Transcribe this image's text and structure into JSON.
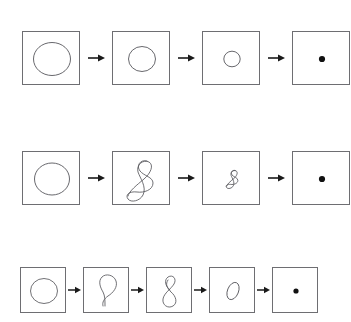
{
  "figure": {
    "background_color": "#ffffff",
    "frame_border_color": "#6e6e72",
    "curve_color": "#4a4a4f",
    "dot_color": "#111111",
    "arrow_color": "#1a1a1a",
    "rows": [
      {
        "id": "row-1",
        "name": "circle-shrinking-sequence",
        "frame_size": 58,
        "frame_height": 54,
        "x": 22,
        "y": 31,
        "gap": 32,
        "panels": [
          {
            "id": "r1p1",
            "shape": "circle",
            "label": "large-circle",
            "radius": 18
          },
          {
            "id": "r1p2",
            "shape": "circle",
            "label": "medium-circle",
            "radius": 13
          },
          {
            "id": "r1p3",
            "shape": "circle",
            "label": "small-circle",
            "radius": 8
          },
          {
            "id": "r1p4",
            "shape": "dot",
            "label": "point",
            "radius": 3
          }
        ],
        "arrows": [
          "arrow-1",
          "arrow-2",
          "arrow-3"
        ]
      },
      {
        "id": "row-2",
        "name": "figure-eight-shrinking-sequence",
        "frame_size": 58,
        "frame_height": 54,
        "x": 22,
        "y": 151,
        "gap": 32,
        "panels": [
          {
            "id": "r2p1",
            "shape": "circle",
            "label": "large-circle",
            "radius": 17
          },
          {
            "id": "r2p2",
            "shape": "figure-eight-tall",
            "label": "large-figure-eight",
            "scale": 1.0
          },
          {
            "id": "r2p3",
            "shape": "figure-eight-tall",
            "label": "small-figure-eight",
            "scale": 0.42
          },
          {
            "id": "r2p4",
            "shape": "dot",
            "label": "point",
            "radius": 3
          }
        ],
        "arrows": [
          "arrow-1",
          "arrow-2",
          "arrow-3"
        ]
      },
      {
        "id": "row-3",
        "name": "loop-to-point-sequence",
        "frame_size": 46,
        "frame_height": 46,
        "x": 20,
        "y": 267,
        "gap": 17,
        "panels": [
          {
            "id": "r3p1",
            "shape": "circle",
            "label": "circle",
            "radius": 14
          },
          {
            "id": "r3p2",
            "shape": "loop-with-tail",
            "label": "loop-with-tail",
            "scale": 1.0
          },
          {
            "id": "r3p3",
            "shape": "figure-eight",
            "label": "figure-eight",
            "scale": 1.0
          },
          {
            "id": "r3p4",
            "shape": "tilted-ellipse",
            "label": "tilted-ellipse",
            "scale": 1.0
          },
          {
            "id": "r3p5",
            "shape": "dot",
            "label": "point",
            "radius": 2.6
          }
        ],
        "arrows": [
          "arrow-1",
          "arrow-2",
          "arrow-3",
          "arrow-4"
        ]
      }
    ]
  }
}
